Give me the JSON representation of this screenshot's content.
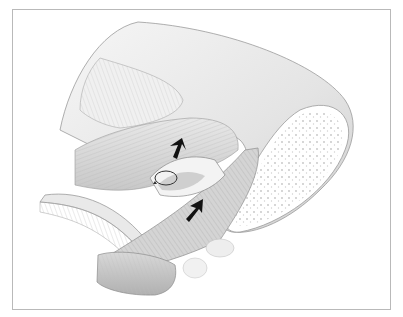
{
  "figure": {
    "type": "anatomical-illustration",
    "style": "grayscale",
    "frame_color": "#b9b9b9",
    "background": "#ffffff",
    "elements": [
      {
        "name": "bone-shaft",
        "shape": "curved-wedge",
        "fill": "#e6e6e6"
      },
      {
        "name": "bone-cross-section",
        "pattern": "cancellous-dots",
        "fill": "#ffffff"
      },
      {
        "name": "upper-muscle-fibers",
        "fill": "#ececec"
      },
      {
        "name": "middle-muscle-fibers",
        "fill": "#d9d9d9"
      },
      {
        "name": "tendon-band",
        "fill": "#cfcfcf"
      },
      {
        "name": "lower-muscle-roll",
        "fill": "#c6c6c6"
      },
      {
        "name": "rotation-indicator",
        "glyph": "circular-arrow"
      },
      {
        "name": "arrow-upper",
        "direction": "up-right",
        "color": "#111111"
      },
      {
        "name": "arrow-lower",
        "direction": "up-right",
        "color": "#111111"
      }
    ]
  }
}
